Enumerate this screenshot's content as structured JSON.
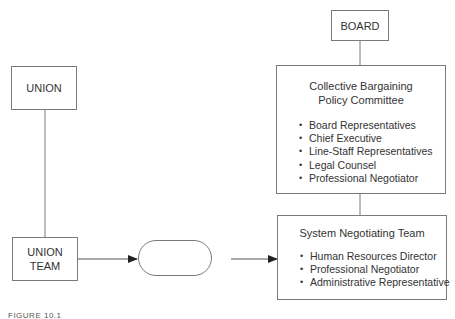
{
  "diagram": {
    "nodes": {
      "board": {
        "label": "BOARD"
      },
      "union": {
        "label": "UNION"
      },
      "union_team": {
        "label": "UNION\nTEAM"
      },
      "policy_committee": {
        "title": "Collective Bargaining\nPolicy Committee",
        "members": [
          "Board Representatives",
          "Chief Executive",
          "Line-Staff Representatives",
          "Legal Counsel",
          "Professional Negotiator"
        ]
      },
      "negotiating_team": {
        "title": "System Negotiating Team",
        "members": [
          "Human Resources Director",
          "Professional Negotiator",
          "Administrative Representative"
        ]
      },
      "mediator": {
        "label": ""
      }
    },
    "edges": [
      {
        "from": "board",
        "to": "policy_committee",
        "type": "line"
      },
      {
        "from": "policy_committee",
        "to": "negotiating_team",
        "type": "line"
      },
      {
        "from": "union",
        "to": "union_team",
        "type": "line"
      },
      {
        "from": "union_team",
        "to": "mediator",
        "type": "arrow"
      },
      {
        "from": "mediator",
        "to": "negotiating_team",
        "type": "arrow"
      }
    ],
    "caption": "FIGURE 10.1"
  },
  "colors": {
    "stroke": "#7a7a7a",
    "text": "#333333"
  }
}
